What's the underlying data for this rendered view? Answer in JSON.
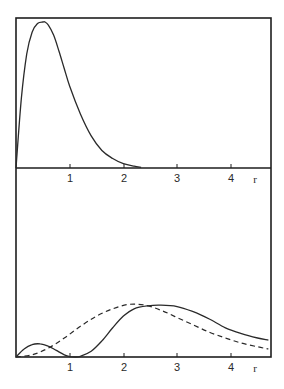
{
  "chart_data": [
    {
      "panel": "top",
      "type": "line",
      "title": "",
      "xlabel": "r",
      "ylabel": "",
      "xlim": [
        0,
        4.7
      ],
      "xticks": [
        1,
        2,
        3,
        4
      ],
      "xtick_labels": [
        "1",
        "2",
        "3",
        "4"
      ],
      "grid": false,
      "legend": null,
      "series": [
        {
          "name": "solid",
          "style": "solid",
          "x": [
            0,
            0.1,
            0.2,
            0.3,
            0.4,
            0.5,
            0.54,
            0.6,
            0.7,
            0.8,
            0.9,
            1.0,
            1.2,
            1.4,
            1.6,
            1.8,
            2.0,
            2.2,
            2.33
          ],
          "y": [
            0,
            0.48,
            0.78,
            0.93,
            0.99,
            1.0,
            1.0,
            0.98,
            0.91,
            0.8,
            0.68,
            0.56,
            0.37,
            0.22,
            0.12,
            0.065,
            0.03,
            0.012,
            0.005
          ]
        }
      ]
    },
    {
      "panel": "bottom",
      "type": "line",
      "title": "",
      "xlabel": "r",
      "ylabel": "",
      "xlim": [
        0,
        4.7
      ],
      "xticks": [
        1,
        2,
        3,
        4
      ],
      "xtick_labels": [
        "1",
        "2",
        "3",
        "4"
      ],
      "grid": false,
      "legend": null,
      "series": [
        {
          "name": "solid",
          "style": "solid",
          "x": [
            0,
            0.15,
            0.3,
            0.45,
            0.6,
            0.75,
            0.9,
            1.0,
            1.1,
            1.2,
            1.4,
            1.6,
            1.8,
            2.0,
            2.2,
            2.45,
            2.7,
            3.0,
            3.3,
            3.6,
            3.9,
            4.2,
            4.5,
            4.7
          ],
          "y": [
            0,
            0.055,
            0.085,
            0.09,
            0.075,
            0.045,
            0.015,
            0.003,
            0.0,
            0.005,
            0.04,
            0.11,
            0.2,
            0.28,
            0.33,
            0.35,
            0.355,
            0.345,
            0.31,
            0.26,
            0.2,
            0.16,
            0.13,
            0.115
          ]
        },
        {
          "name": "dashed",
          "style": "dashed",
          "x": [
            0,
            0.3,
            0.6,
            0.9,
            1.2,
            1.5,
            1.8,
            2.1,
            2.4,
            2.7,
            3.0,
            3.3,
            3.6,
            3.9,
            4.2,
            4.5,
            4.7
          ],
          "y": [
            0,
            0.015,
            0.06,
            0.13,
            0.21,
            0.28,
            0.33,
            0.36,
            0.355,
            0.32,
            0.27,
            0.22,
            0.17,
            0.13,
            0.095,
            0.07,
            0.055
          ]
        }
      ]
    }
  ],
  "axes": {
    "top": {
      "tick_labels": [
        "1",
        "2",
        "3",
        "4"
      ],
      "var_label": "r"
    },
    "bottom": {
      "tick_labels": [
        "1",
        "2",
        "3",
        "4"
      ],
      "var_label": "r"
    }
  },
  "colors": {
    "line": "#2a2a2a",
    "frame": "#1e1e1e",
    "background": "#ffffff"
  }
}
